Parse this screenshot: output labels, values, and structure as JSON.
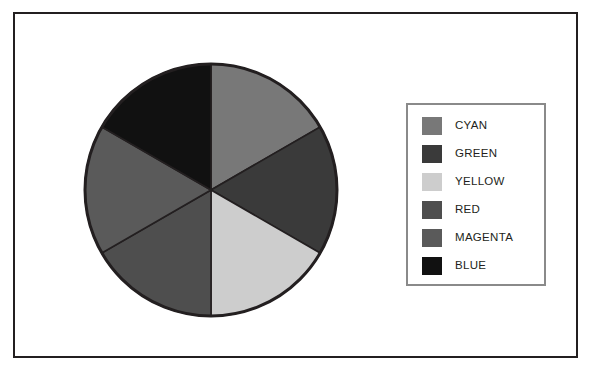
{
  "figure": {
    "frame_color": "#231f20",
    "background": "#ffffff"
  },
  "legend": {
    "border_color": "#8a8a8a",
    "items": [
      {
        "label": "CYAN",
        "color": "#787878"
      },
      {
        "label": "GREEN",
        "color": "#3a3a3a"
      },
      {
        "label": "YELLOW",
        "color": "#cdcdcd"
      },
      {
        "label": "RED",
        "color": "#4e4e4e"
      },
      {
        "label": "MAGENTA",
        "color": "#5a5a5a"
      },
      {
        "label": "BLUE",
        "color": "#111111"
      }
    ]
  },
  "chart_data": {
    "type": "pie",
    "title": "",
    "legend_position": "right",
    "grid": false,
    "start_angle_deg": 0,
    "direction": "clockwise",
    "outline_color": "#231f20",
    "categories": [
      "CYAN",
      "GREEN",
      "YELLOW",
      "RED",
      "MAGENTA",
      "BLUE"
    ],
    "values": [
      1,
      1,
      1,
      1,
      1,
      1
    ],
    "percentages": [
      16.67,
      16.67,
      16.67,
      16.67,
      16.67,
      16.67
    ],
    "slice_angles_deg": [
      60,
      60,
      60,
      60,
      60,
      60
    ],
    "colors": [
      "#787878",
      "#3a3a3a",
      "#cdcdcd",
      "#4e4e4e",
      "#5a5a5a",
      "#111111"
    ],
    "center": {
      "x": 130,
      "y": 130
    },
    "radius": 126
  }
}
